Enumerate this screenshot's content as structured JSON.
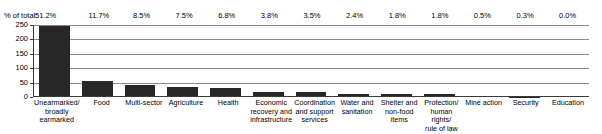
{
  "chart_data": {
    "type": "bar",
    "title": "",
    "subtitle": "",
    "xlabel": "",
    "ylabel": "",
    "ylim": [
      0,
      250
    ],
    "yticks": [
      0,
      50,
      100,
      150,
      200,
      250
    ],
    "ytick_labels": [
      "0",
      "50",
      "100",
      "150",
      "200",
      "250"
    ],
    "grid": true,
    "legend": null,
    "annotation_row_label": "% of total:",
    "categories": [
      "Unearmarked/\nbroadly\nearmarked",
      "Food",
      "Multi-sector",
      "Agriculture",
      "Health",
      "Economic\nrecovery and\ninfrastructure",
      "Coordination\nand support\nservices",
      "Water and\nsanitation",
      "Shelter and\nnon-food\nitems",
      "Protection/\nhuman rights/\nrule of law",
      "Mine action",
      "Security",
      "Education"
    ],
    "values": [
      245,
      56,
      41,
      36,
      33,
      18,
      17,
      11,
      9,
      9,
      2,
      1,
      0
    ],
    "percent_labels": [
      "51.2%",
      "11.7%",
      "8.5%",
      "7.5%",
      "6.8%",
      "3.8%",
      "3.5%",
      "2.4%",
      "1.8%",
      "1.8%",
      "0.5%",
      "0.3%",
      "0.0%"
    ],
    "percent_values": [
      51.2,
      11.7,
      8.5,
      7.5,
      6.8,
      3.8,
      3.5,
      2.4,
      1.8,
      1.8,
      0.5,
      0.3,
      0.0
    ],
    "bar_color": "#272727",
    "gridline_color": "#8a8a8a",
    "axis_color": "#3a3a3a"
  }
}
